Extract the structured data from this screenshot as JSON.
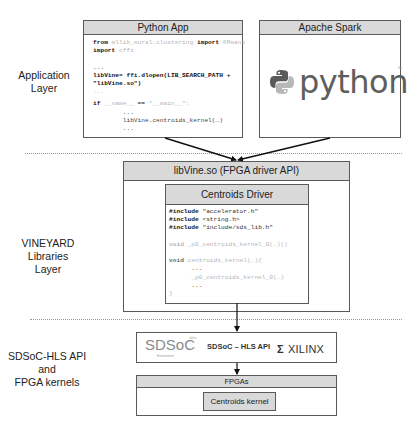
{
  "layers": {
    "application": {
      "label_line1": "Application",
      "label_line2": "Layer"
    },
    "libraries": {
      "label_line1": "VINEYARD",
      "label_line2": "Libraries",
      "label_line3": "Layer"
    },
    "fpga": {
      "label_line1": "SDSoC-HLS API",
      "label_line2": "and",
      "label_line3": "FPGA kernels"
    }
  },
  "python_app": {
    "title": "Python App",
    "code": {
      "l1_kw": "from",
      "l1_mod": " mllib_eural.clustering ",
      "l1_kw2": "import",
      "l1_rest": " KMeans",
      "l2_kw": "import",
      "l2_rest": " cffi",
      "l3": "...",
      "l4": "libVine= ffi.dlopen(LIB_SEARCH_PATH +",
      "l5": "\"libVine.so\")",
      "l6": "...",
      "l7_kw": "if",
      "l7_a": " __name__",
      "l7_b": " == ",
      "l7_c": "\"__main__\":",
      "l8": "        ...",
      "l9": "        libVine.centroids_kernel(…)",
      "l10": "        ..."
    }
  },
  "apache_spark": {
    "title": "Apache Spark",
    "logo_text": "python",
    "logo_tm": "™",
    "logo_colors": {
      "blue": "#5b5b5b",
      "yellow": "#b5b5b5"
    }
  },
  "libvine": {
    "title": "libVine.so (FPGA driver API)",
    "centroids_driver": {
      "title": "Centroids Driver",
      "code": {
        "inc_kw": "#include",
        "inc1": " \"accelerator.h\"",
        "inc2": " <string.h>",
        "inc3": " \"include/sds_lib.h\"",
        "void_kw": "void",
        "fn1": " _p0_centroids_kernel_0(…)()",
        "fn2": " centroids_kernel(…){",
        "b1": "      ...",
        "b2": "      _p0_centroids_kernel_0(…)",
        "b3": "      ...",
        "close": "}"
      }
    }
  },
  "sdsoc": {
    "logo_text": "SDSoC",
    "logo_sub": "Environment",
    "logo_sup": "alpha",
    "label": "SDSoC – HLS API",
    "xilinx_text": "XILINX",
    "xilinx_mark": "Σ"
  },
  "fpgas": {
    "title": "FPGAs",
    "kernel": "Centroids kernel"
  },
  "colors": {
    "header_bg": "#d9d9d9",
    "border": "#5a5a5a",
    "separator": "#9a9a9a",
    "arrow": "#111111"
  }
}
